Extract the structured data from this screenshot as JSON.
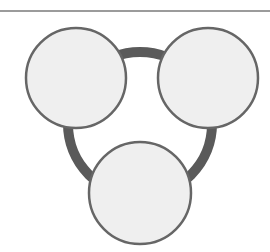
{
  "diagram": {
    "type": "three-circle-ring",
    "colors": {
      "background": "#ffffff",
      "rule": "#7a7a7a",
      "ring": "#5a5a5a",
      "circle_fill": "#efefef",
      "circle_stroke": "#666666"
    },
    "top_rule": {
      "y": 11
    },
    "ring": {
      "cx": 140,
      "cy": 124,
      "r": 72,
      "stroke_width": 10
    },
    "nodes": [
      {
        "name": "top-left",
        "cx": 76,
        "cy": 78,
        "r": 50
      },
      {
        "name": "top-right",
        "cx": 208,
        "cy": 78,
        "r": 50
      },
      {
        "name": "bottom",
        "cx": 140,
        "cy": 193,
        "r": 51
      }
    ]
  }
}
